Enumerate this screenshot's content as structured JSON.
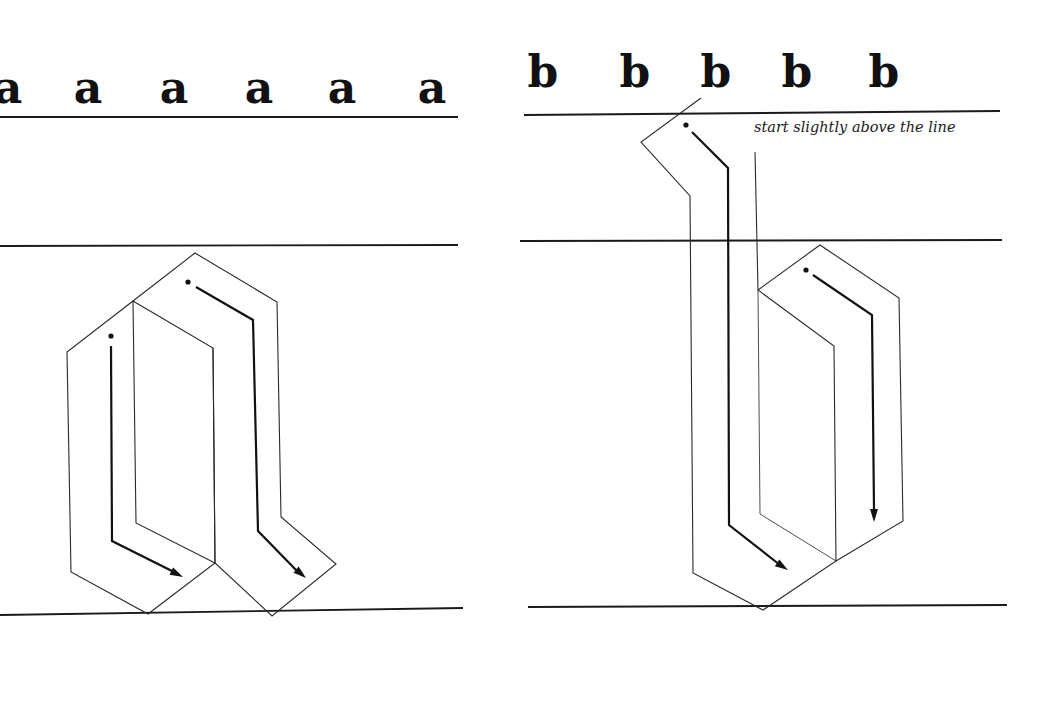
{
  "page": {
    "background": "#ffffff",
    "ink": "#111111"
  },
  "left_panel": {
    "letter": "a",
    "model_glyphs": [
      {
        "char": "a",
        "x": 8
      },
      {
        "char": "a",
        "x": 88
      },
      {
        "char": "a",
        "x": 174
      },
      {
        "char": "a",
        "x": 259
      },
      {
        "char": "a",
        "x": 342
      },
      {
        "char": "a",
        "x": 432
      }
    ],
    "glyph_baseline_y": 103,
    "guide_lines": [
      {
        "name": "ascender-line",
        "x1": 0,
        "y1": 117,
        "x2": 458,
        "y2": 117
      },
      {
        "name": "waist-line",
        "x1": 0,
        "y1": 246,
        "x2": 458,
        "y2": 245
      },
      {
        "name": "base-line",
        "x1": 0,
        "y1": 615,
        "x2": 463,
        "y2": 608
      }
    ],
    "stroke_outlines": [
      {
        "name": "stroke-1-outline",
        "points": "133,301 67,352 71,572 148,614 215,563 213,348"
      },
      {
        "name": "stroke-2-outline",
        "points": "133,301 195,253 277,302 281,517 336,564 272,616 215,563 213,348 133,301 136,523 215,563"
      }
    ],
    "strokes": [
      {
        "name": "stroke-1",
        "order": 1,
        "dot": {
          "x": 111,
          "y": 336
        },
        "path": "111,346 112,541 176,573",
        "arrow_tip": {
          "x": 183,
          "y": 577
        },
        "arrow_angle": 27
      },
      {
        "name": "stroke-2",
        "order": 2,
        "dot": {
          "x": 188,
          "y": 282
        },
        "path": "196,287 253,320 258,531 298,572",
        "arrow_tip": {
          "x": 306,
          "y": 578
        },
        "arrow_angle": 40
      }
    ]
  },
  "right_panel": {
    "letter": "b",
    "model_glyphs": [
      {
        "char": "b",
        "x": 543
      },
      {
        "char": "b",
        "x": 635
      },
      {
        "char": "b",
        "x": 716
      },
      {
        "char": "b",
        "x": 797
      },
      {
        "char": "b",
        "x": 884
      }
    ],
    "glyph_baseline_y": 87,
    "annotation": {
      "text": "start slightly above the line",
      "x": 754,
      "y": 132
    },
    "guide_lines": [
      {
        "name": "ascender-line",
        "x1": 524,
        "y1": 115,
        "x2": 1000,
        "y2": 111
      },
      {
        "name": "waist-line",
        "x1": 520,
        "y1": 241,
        "x2": 1002,
        "y2": 240
      },
      {
        "name": "base-line",
        "x1": 528,
        "y1": 607,
        "x2": 1007,
        "y2": 605
      }
    ],
    "stroke_outlines": [
      {
        "name": "stroke-1-outline",
        "points": "701,98 641,142 690,196 693,573 763,610 836,561 834,346 758,290 755,152"
      },
      {
        "name": "stroke-1-inner",
        "points": "758,290 760,514 836,561"
      },
      {
        "name": "stroke-2-outline",
        "points": "758,290 820,245 899,298 903,521 836,561"
      }
    ],
    "strokes": [
      {
        "name": "stroke-1",
        "order": 1,
        "dot": {
          "x": 686,
          "y": 125
        },
        "path": "692,132 728,168 729,525 780,565",
        "arrow_tip": {
          "x": 788,
          "y": 570
        },
        "arrow_angle": 33
      },
      {
        "name": "stroke-2",
        "order": 2,
        "dot": {
          "x": 806,
          "y": 270
        },
        "path": "813,275 872,315 874,510",
        "arrow_tip": {
          "x": 874,
          "y": 522
        },
        "arrow_angle": 90
      }
    ]
  }
}
